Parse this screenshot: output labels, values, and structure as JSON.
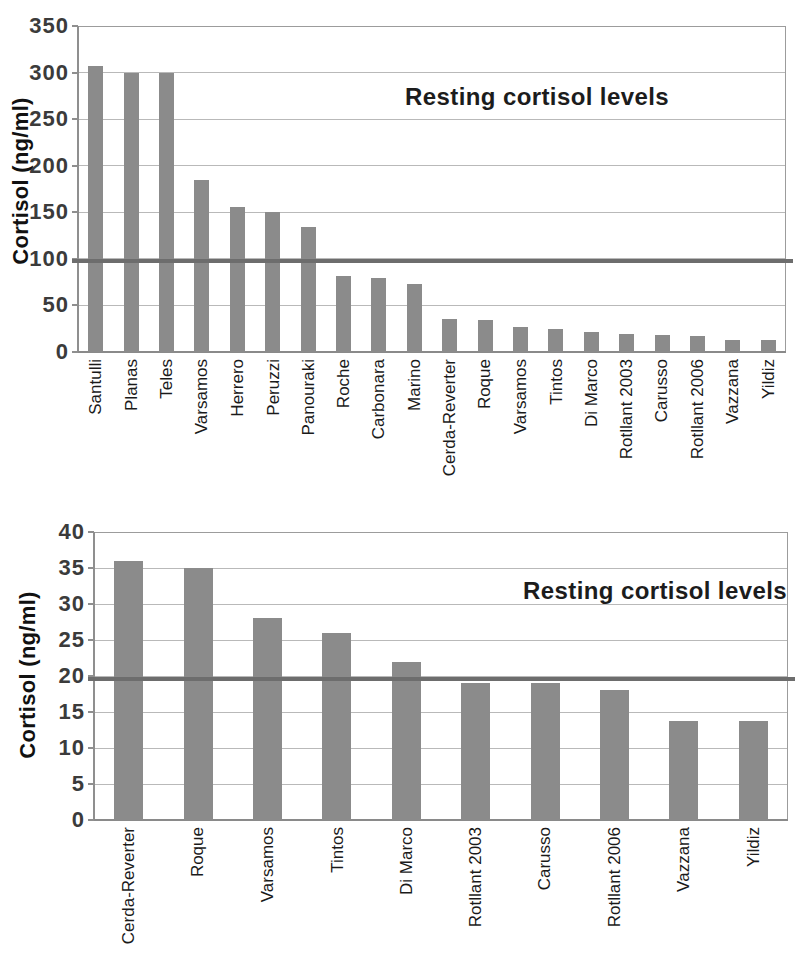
{
  "chart_data": [
    {
      "type": "bar",
      "title": "Resting cortisol levels",
      "ylabel": "Cortisol (ng/ml)",
      "ylim": [
        0,
        350
      ],
      "ytick_step": 50,
      "grid": true,
      "legend": false,
      "bar_color": "#8b8b8b",
      "reference_line": {
        "value": 100,
        "color": "#6d6d6d"
      },
      "categories": [
        "Santulli",
        "Planas",
        "Teles",
        "Varsamos",
        "Herrero",
        "Peruzzi",
        "Panouraki",
        "Roche",
        "Carbonara",
        "Marino",
        "Cerda-Reverter",
        "Roque",
        "Varsamos",
        "Tintos",
        "Di Marco",
        "Rotllant 2003",
        "Carusso",
        "Rotllant 2006",
        "Vazzana",
        "Yildiz"
      ],
      "values": [
        307,
        300,
        300,
        185,
        156,
        150,
        134,
        82,
        79,
        73,
        35,
        34,
        27,
        25,
        22,
        19,
        18,
        17,
        13,
        13
      ]
    },
    {
      "type": "bar",
      "title": "Resting cortisol levels",
      "ylabel": "Cortisol (ng/ml)",
      "ylim": [
        0,
        40
      ],
      "ytick_step": 5,
      "grid": true,
      "legend": false,
      "bar_color": "#8b8b8b",
      "reference_line": {
        "value": 19.8,
        "color": "#6d6d6d"
      },
      "categories": [
        "Cerda-Reverter",
        "Roque",
        "Varsamos",
        "Tintos",
        "Di Marco",
        "Rotllant 2003",
        "Carusso",
        "Rotllant 2006",
        "Vazzana",
        "Yildiz"
      ],
      "values": [
        36,
        35,
        28,
        26,
        22,
        19,
        19,
        18,
        13.8,
        13.8
      ]
    }
  ]
}
